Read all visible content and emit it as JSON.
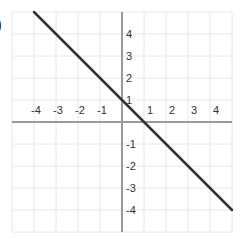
{
  "problem_label": ")",
  "chart_data": {
    "type": "line",
    "title": "",
    "xlabel": "",
    "ylabel": "",
    "xlim": [
      -5,
      5
    ],
    "ylim": [
      -5,
      5
    ],
    "grid": true,
    "x_ticks": [
      "-4",
      "-3",
      "-2",
      "-1",
      "1",
      "2",
      "3",
      "4"
    ],
    "y_ticks": [
      "4",
      "3",
      "2",
      "1",
      "-1",
      "-2",
      "-3",
      "-4"
    ],
    "series": [
      {
        "name": "y = -x + 1",
        "slope": -1,
        "intercept": 1,
        "x": [
          -4,
          5
        ],
        "y": [
          5,
          -4
        ],
        "color": "#333333"
      }
    ]
  },
  "style": {
    "grid_color": "#e6e6e6",
    "axis_color": "#9a9a9a",
    "line_color": "#333333"
  }
}
